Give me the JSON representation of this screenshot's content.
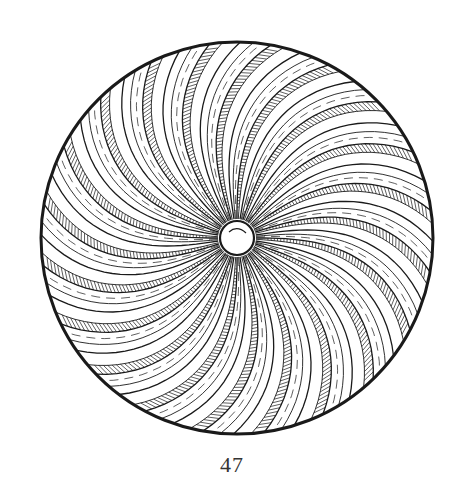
{
  "figure": {
    "label": "47",
    "colors": {
      "ink": "#1a1a1a",
      "paper": "#ffffff"
    },
    "disc": {
      "cx": 237,
      "cy": 238,
      "r": 196
    },
    "center_boss": {
      "r": 17
    },
    "rays": 40,
    "twist_degrees": 28
  }
}
